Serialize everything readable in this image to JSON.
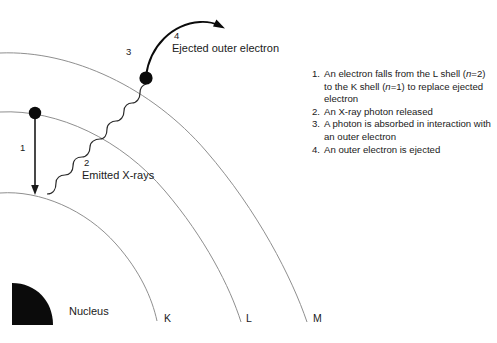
{
  "figure": {
    "background_color": "#ffffff",
    "ink_color": "#1a1a1a",
    "shell_line_color": "#8a8a8a"
  },
  "diagram": {
    "nucleus_label": "Nucleus",
    "shells": [
      {
        "letter": "K",
        "x": 164,
        "y": 324
      },
      {
        "letter": "L",
        "x": 246,
        "y": 324
      },
      {
        "letter": "M",
        "x": 313,
        "y": 324
      }
    ],
    "callouts": [
      {
        "id": "1",
        "number": "1",
        "caption": "",
        "num_x": 20,
        "num_y": 148
      },
      {
        "id": "2",
        "number": "2",
        "caption": "Emitted X-rays",
        "num_x": 84,
        "num_y": 161,
        "cap_x": 82,
        "cap_y": 172
      },
      {
        "id": "3",
        "number": "3",
        "caption": "",
        "num_x": 126,
        "num_y": 52
      },
      {
        "id": "4",
        "number": "4",
        "caption": "Ejected outer electron",
        "num_x": 174,
        "num_y": 35,
        "cap_x": 172,
        "cap_y": 46
      }
    ]
  },
  "legend": {
    "items": [
      {
        "number": "1.",
        "parts": [
          {
            "type": "plain",
            "text": "An electron falls from the L shell ("
          },
          {
            "type": "italic",
            "text": "n"
          },
          {
            "type": "plain",
            "text": "=2) to the K shell ("
          },
          {
            "type": "italic",
            "text": "n"
          },
          {
            "type": "plain",
            "text": "=1) to replace ejected electron"
          }
        ]
      },
      {
        "number": "2.",
        "parts": [
          {
            "type": "plain",
            "text": "An X-ray photon released"
          }
        ]
      },
      {
        "number": "3.",
        "parts": [
          {
            "type": "plain",
            "text": "A photon is absorbed in interaction with an outer electron"
          }
        ]
      },
      {
        "number": "4.",
        "parts": [
          {
            "type": "plain",
            "text": "An outer electron is ejected"
          }
        ]
      }
    ]
  }
}
